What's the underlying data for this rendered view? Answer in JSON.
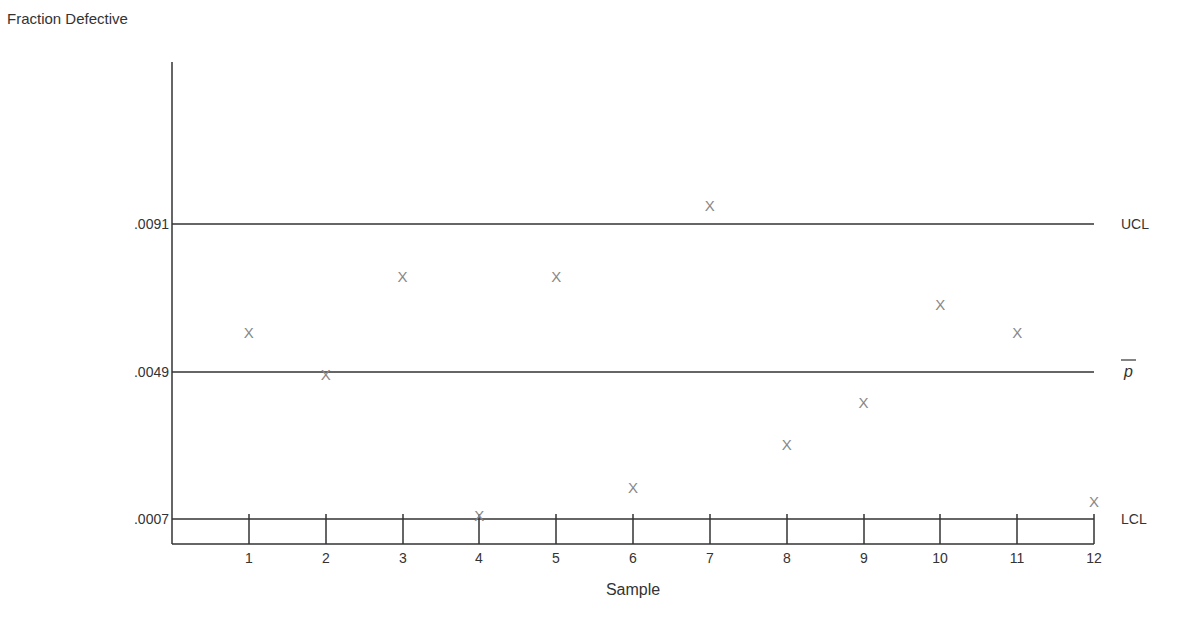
{
  "chart_data": {
    "type": "scatter",
    "subtype": "p-chart (control chart)",
    "title": "",
    "xlabel": "Sample",
    "ylabel": "Fraction Defective",
    "x": [
      1,
      2,
      3,
      4,
      5,
      6,
      7,
      8,
      9,
      10,
      11,
      12
    ],
    "series": [
      {
        "name": "Fraction Defective",
        "marker": "X",
        "values": [
          0.006,
          0.0048,
          0.0076,
          0.0008,
          0.0076,
          0.0016,
          0.0096,
          0.0028,
          0.004,
          0.0068,
          0.006,
          0.0012
        ]
      }
    ],
    "control_lines": [
      {
        "name": "UCL",
        "label": "UCL",
        "value": 0.0091,
        "tick_label": ".0091"
      },
      {
        "name": "center",
        "label": "p̄",
        "value": 0.0049,
        "tick_label": ".0049"
      },
      {
        "name": "LCL",
        "label": "LCL",
        "value": 0.0007,
        "tick_label": ".0007"
      }
    ],
    "x_tick_labels": [
      "1",
      "2",
      "3",
      "4",
      "5",
      "6",
      "7",
      "8",
      "9",
      "10",
      "11",
      "12"
    ],
    "y_tick_labels": [
      ".0091",
      ".0049",
      ".0007"
    ],
    "xlim": [
      0,
      12
    ],
    "ylim": [
      0,
      0.0137
    ],
    "grid": false,
    "legend": "none (lines labeled at right)"
  },
  "labels": {
    "ylabel": "Fraction Defective",
    "xlabel": "Sample",
    "ucl": "UCL",
    "center": "p",
    "lcl": "LCL",
    "marker": "X"
  },
  "colors": {
    "axis": "#333333",
    "line": "#333333",
    "marker": "#888888",
    "text": "#333333"
  }
}
